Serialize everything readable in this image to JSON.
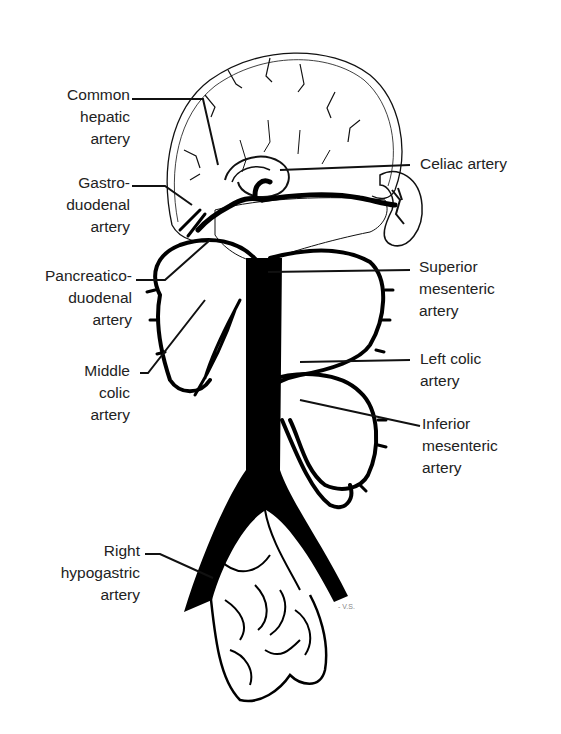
{
  "diagram": {
    "labels_left": [
      {
        "id": "common-hepatic",
        "lines": [
          "Common",
          "hepatic",
          "artery"
        ]
      },
      {
        "id": "gastroduodenal",
        "lines": [
          "Gastro-",
          "duodenal",
          "artery"
        ]
      },
      {
        "id": "pancreaticoduodenal",
        "lines": [
          "Pancreatico-",
          "duodenal",
          "artery"
        ]
      },
      {
        "id": "middle-colic",
        "lines": [
          "Middle",
          "colic",
          "artery"
        ]
      },
      {
        "id": "right-hypogastric",
        "lines": [
          "Right",
          "hypogastric",
          "artery"
        ]
      }
    ],
    "labels_right": [
      {
        "id": "celiac",
        "lines": [
          "Celiac artery"
        ]
      },
      {
        "id": "superior-mesenteric",
        "lines": [
          "Superior",
          "mesenteric",
          "artery"
        ]
      },
      {
        "id": "left-colic",
        "lines": [
          "Left colic",
          "artery"
        ]
      },
      {
        "id": "inferior-mesenteric",
        "lines": [
          "Inferior",
          "mesenteric",
          "artery"
        ]
      }
    ],
    "signature": "- V.S."
  }
}
